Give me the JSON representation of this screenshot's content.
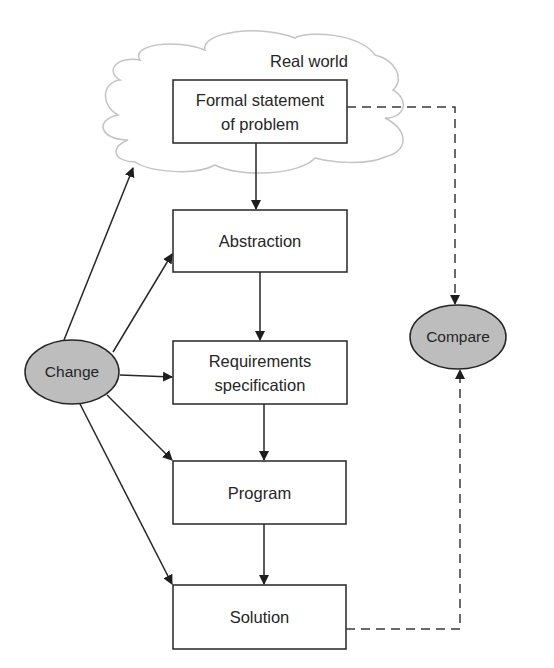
{
  "diagram": {
    "cloud_label": "Real world",
    "boxes": [
      {
        "id": "formal",
        "label": "Formal statement\nof problem"
      },
      {
        "id": "abstraction",
        "label": "Abstraction"
      },
      {
        "id": "requirements",
        "label": "Requirements\nspecification"
      },
      {
        "id": "program",
        "label": "Program"
      },
      {
        "id": "solution",
        "label": "Solution"
      }
    ],
    "ellipses": [
      {
        "id": "change",
        "label": "Change"
      },
      {
        "id": "compare",
        "label": "Compare"
      }
    ],
    "edges": [
      {
        "from": "formal",
        "to": "abstraction",
        "style": "solid"
      },
      {
        "from": "abstraction",
        "to": "requirements",
        "style": "solid"
      },
      {
        "from": "requirements",
        "to": "program",
        "style": "solid"
      },
      {
        "from": "program",
        "to": "solution",
        "style": "solid"
      },
      {
        "from": "change",
        "to": "real-world",
        "style": "solid"
      },
      {
        "from": "change",
        "to": "abstraction",
        "style": "solid"
      },
      {
        "from": "change",
        "to": "requirements",
        "style": "solid"
      },
      {
        "from": "change",
        "to": "program",
        "style": "solid"
      },
      {
        "from": "change",
        "to": "solution",
        "style": "solid"
      },
      {
        "from": "formal",
        "to": "compare",
        "style": "dashed"
      },
      {
        "from": "solution",
        "to": "compare",
        "style": "dashed"
      }
    ],
    "colors": {
      "stroke": "#262626",
      "ellipse_fill": "#bdbdbd",
      "cloud_stroke": "#c4c4c4"
    }
  }
}
